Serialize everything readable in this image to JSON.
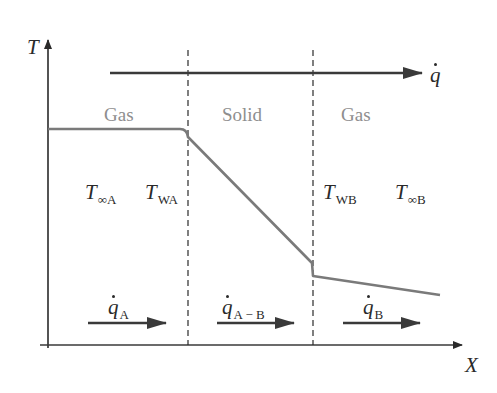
{
  "diagram": {
    "axes": {
      "y_label": "T",
      "x_label": "X"
    },
    "heat_flow": {
      "symbol": "q",
      "direction": "left-to-right"
    },
    "regions": [
      {
        "label": "Gas"
      },
      {
        "label": "Solid"
      },
      {
        "label": "Gas"
      }
    ],
    "temperatures": [
      {
        "symbol": "T",
        "subscript": "∞A"
      },
      {
        "symbol": "T",
        "subscript": "WA"
      },
      {
        "symbol": "T",
        "subscript": "WB"
      },
      {
        "symbol": "T",
        "subscript": "∞B"
      }
    ],
    "flux_arrows": [
      {
        "symbol": "q",
        "subscript": "A"
      },
      {
        "symbol": "q",
        "subscript": "A − B"
      },
      {
        "symbol": "q",
        "subscript": "B"
      }
    ],
    "colors": {
      "axis": "#2a2a2a",
      "curve": "#7a7a7a",
      "arrow": "#3a3a3a",
      "region_label": "#8e8e8e",
      "dashed": "#2a2a2a"
    }
  }
}
